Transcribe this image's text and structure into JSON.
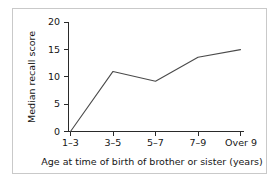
{
  "chart_data": {
    "type": "line",
    "title": "",
    "xlabel": "Age at time of birth of brother or sister (years)",
    "ylabel": "Median recall score",
    "categories": [
      "1–3",
      "3–5",
      "5–7",
      "7–9",
      "Over 9"
    ],
    "values": [
      0,
      11,
      9.2,
      13.6,
      15
    ],
    "ylim": [
      0,
      20
    ],
    "yticks": [
      0,
      5,
      10,
      15,
      20
    ],
    "ytick_labels": [
      "0",
      "5",
      "10",
      "15",
      "20"
    ],
    "grid": false,
    "legend": null,
    "line_color": "#4a4a4a",
    "axis_color": "#2a2a2a",
    "frame_color": "#c9c9c9",
    "background": "#ffffff"
  },
  "axes": {
    "y_label": "Median recall score",
    "x_label": "Age at time of birth of brother or sister (years)",
    "y_tick_0": "0",
    "y_tick_1": "5",
    "y_tick_2": "10",
    "y_tick_3": "15",
    "y_tick_4": "20",
    "x_tick_0": "1–3",
    "x_tick_1": "3–5",
    "x_tick_2": "5–7",
    "x_tick_3": "7–9",
    "x_tick_4": "Over 9"
  }
}
